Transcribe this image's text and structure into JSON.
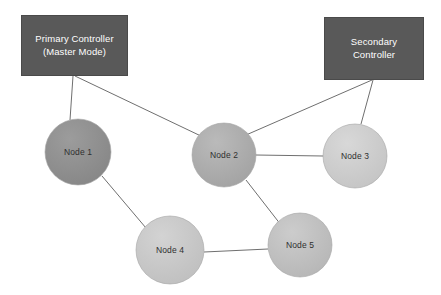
{
  "diagram": {
    "type": "network-topology",
    "width": 441,
    "height": 295,
    "background_color": "#ffffff",
    "controllers": [
      {
        "id": "primary-controller",
        "label_line1": "Primary Controller",
        "label_line2": "(Master Mode)",
        "x": 21,
        "y": 15,
        "width": 107,
        "height": 61,
        "fill": "#595959",
        "text_color": "#ffffff"
      },
      {
        "id": "secondary-controller",
        "label_line1": "Secondary",
        "label_line2": "Controller",
        "x": 324,
        "y": 17,
        "width": 100,
        "height": 63,
        "fill": "#595959",
        "text_color": "#ffffff"
      }
    ],
    "nodes": [
      {
        "id": "node-1",
        "label": "Node 1",
        "cx": 78,
        "cy": 152,
        "r": 33,
        "fill": "#8d8d8d",
        "fill_light": "#9a9a9a",
        "text_color": "#2f2f2f"
      },
      {
        "id": "node-2",
        "label": "Node 2",
        "cx": 224,
        "cy": 155,
        "r": 32,
        "fill": "#a9a9a9",
        "fill_light": "#b8b8b8",
        "text_color": "#2f2f2f"
      },
      {
        "id": "node-3",
        "label": "Node 3",
        "cx": 355,
        "cy": 156,
        "r": 32,
        "fill": "#cacaca",
        "fill_light": "#d6d6d6",
        "text_color": "#2f2f2f"
      },
      {
        "id": "node-4",
        "label": "Node 4",
        "cx": 170,
        "cy": 250,
        "r": 34,
        "fill": "#c5c5c5",
        "fill_light": "#d2d2d2",
        "text_color": "#2f2f2f"
      },
      {
        "id": "node-5",
        "label": "Node 5",
        "cx": 300,
        "cy": 245,
        "r": 32,
        "fill": "#bdbdbd",
        "fill_light": "#cbcbcb",
        "text_color": "#2f2f2f"
      }
    ],
    "edges": [
      {
        "id": "edge-primary-node1",
        "from": "primary-controller",
        "to": "node-1",
        "x1": 73,
        "y1": 76,
        "x2": 70,
        "y2": 120
      },
      {
        "id": "edge-primary-node2",
        "from": "primary-controller",
        "to": "node-2",
        "x1": 75,
        "y1": 76,
        "x2": 203,
        "y2": 137
      },
      {
        "id": "edge-secondary-node2",
        "from": "secondary-controller",
        "to": "node-2",
        "x1": 372,
        "y1": 80,
        "x2": 246,
        "y2": 135
      },
      {
        "id": "edge-secondary-node3",
        "from": "secondary-controller",
        "to": "node-3",
        "x1": 373,
        "y1": 80,
        "x2": 361,
        "y2": 124
      },
      {
        "id": "edge-node2-node3",
        "from": "node-2",
        "to": "node-3",
        "x1": 256,
        "y1": 155,
        "x2": 323,
        "y2": 156
      },
      {
        "id": "edge-node1-node4",
        "from": "node-1",
        "to": "node-4",
        "x1": 102,
        "y1": 176,
        "x2": 146,
        "y2": 228
      },
      {
        "id": "edge-node2-node5",
        "from": "node-2",
        "to": "node-5",
        "x1": 246,
        "y1": 180,
        "x2": 281,
        "y2": 225
      },
      {
        "id": "edge-node4-node5",
        "from": "node-4",
        "to": "node-5",
        "x1": 204,
        "y1": 252,
        "x2": 268,
        "y2": 249
      }
    ],
    "edge_color": "#6f6f6f",
    "edge_width": 1
  }
}
